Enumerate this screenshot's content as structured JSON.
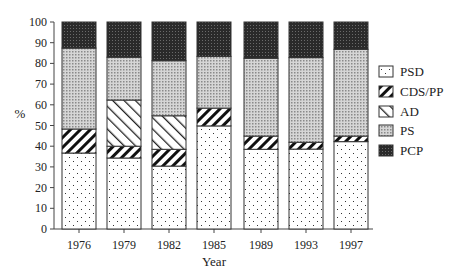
{
  "chart_data": {
    "type": "bar",
    "stacked": true,
    "title": "",
    "xlabel": "Year",
    "ylabel": "%",
    "ylim": [
      0,
      100
    ],
    "yticks": [
      0,
      10,
      20,
      30,
      40,
      50,
      60,
      70,
      80,
      90,
      100
    ],
    "grid": false,
    "legend_position": "right",
    "categories": [
      "1976",
      "1979",
      "1982",
      "1985",
      "1989",
      "1993",
      "1997"
    ],
    "series": [
      {
        "name": "PSD",
        "pattern": "sparse-dots",
        "values": [
          36.7,
          34.3,
          30.4,
          49.8,
          38.5,
          38.6,
          42.2
        ]
      },
      {
        "name": "CDS/PP",
        "pattern": "thick-diagonal",
        "values": [
          11.6,
          5.7,
          8.1,
          8.6,
          6.4,
          3.3,
          2.7
        ]
      },
      {
        "name": "AD",
        "pattern": "thin-backslash",
        "values": [
          0,
          22.3,
          16.2,
          0,
          0,
          0,
          0
        ]
      },
      {
        "name": "PS",
        "pattern": "light-dots",
        "values": [
          39.1,
          20.7,
          26.6,
          25.0,
          37.6,
          40.9,
          41.9
        ]
      },
      {
        "name": "PCP",
        "pattern": "dark-dots",
        "values": [
          12.6,
          17.0,
          18.7,
          16.6,
          17.5,
          17.2,
          13.2
        ]
      }
    ]
  },
  "legend": {
    "items": [
      {
        "label": "PSD"
      },
      {
        "label": "CDS/PP"
      },
      {
        "label": "AD"
      },
      {
        "label": "PS"
      },
      {
        "label": "PCP"
      }
    ]
  },
  "axes": {
    "x_title": "Year",
    "y_title": "%"
  }
}
